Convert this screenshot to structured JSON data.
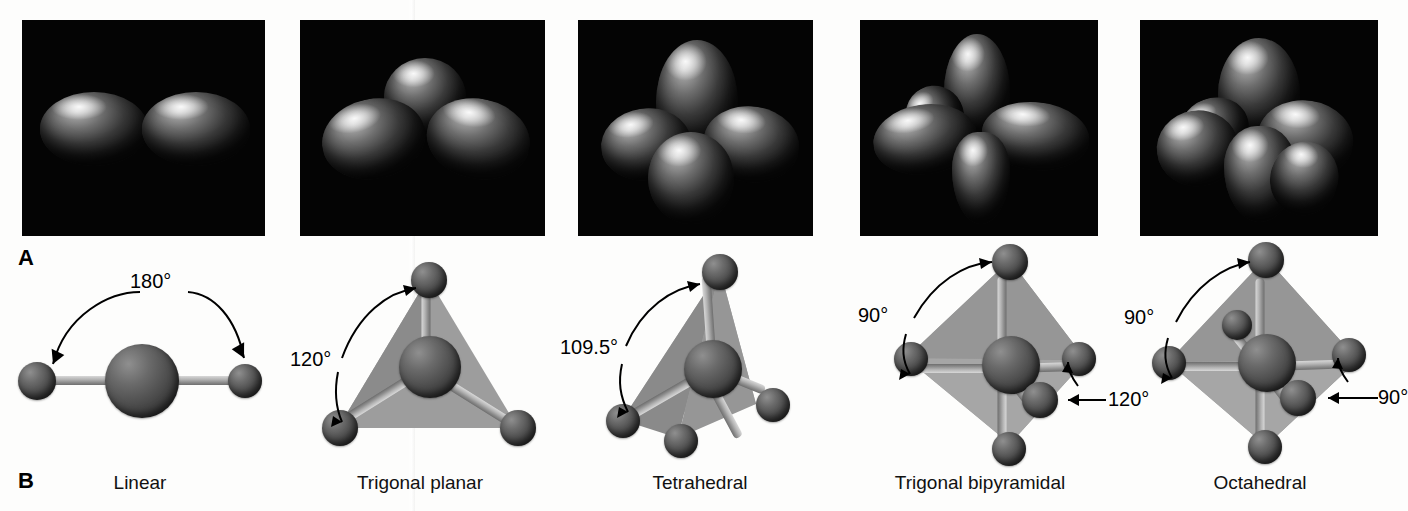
{
  "figure": {
    "section_a_letter": "A",
    "section_b_letter": "B",
    "background_color": "#fdfdfc",
    "panel_background_color": "#040404",
    "atom_color": "#4d4d4d",
    "bond_color": "#b4b4b4",
    "face_color": "#9a9a9a"
  },
  "geometries": [
    {
      "name": "Linear",
      "orbital_lobes": 2,
      "angles": [
        "180°"
      ],
      "domain_count": 2
    },
    {
      "name": "Trigonal planar",
      "orbital_lobes": 3,
      "angles": [
        "120°"
      ],
      "domain_count": 3
    },
    {
      "name": "Tetrahedral",
      "orbital_lobes": 4,
      "angles": [
        "109.5°"
      ],
      "domain_count": 4
    },
    {
      "name": "Trigonal bipyramidal",
      "orbital_lobes": 5,
      "angles": [
        "90°",
        "120°"
      ],
      "domain_count": 5
    },
    {
      "name": "Octahedral",
      "orbital_lobes": 6,
      "angles": [
        "90°",
        "90°"
      ],
      "domain_count": 6
    }
  ]
}
